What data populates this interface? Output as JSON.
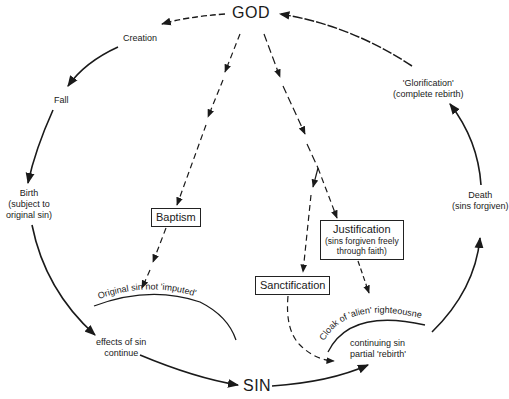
{
  "nodes": {
    "god": "GOD",
    "sin": "SIN",
    "creation": "Creation",
    "fall": "Fall",
    "birth": {
      "title": "Birth",
      "sub1": "(subject to",
      "sub2": "original sin)"
    },
    "effects": {
      "line1": "effects of sin",
      "line2": "continue"
    },
    "original_sin_arc": "Original sin not 'imputed'",
    "baptism": "Baptism",
    "justification": {
      "title": "Justification",
      "sub1": "(sins forgiven freely",
      "sub2": "through faith)"
    },
    "sanctification": "Sanctification",
    "cloak_arc": "Cloak of 'alien' righteousness",
    "continuing": {
      "line1": "continuing sin",
      "line2": "partial 'rebirth'"
    },
    "death": {
      "title": "Death",
      "sub": "(sins forgiven)"
    },
    "glorification": {
      "title": "'Glorification'",
      "sub": "(complete rebirth)"
    }
  },
  "colors": {
    "ink": "#1a1a1a",
    "background": "#ffffff"
  }
}
